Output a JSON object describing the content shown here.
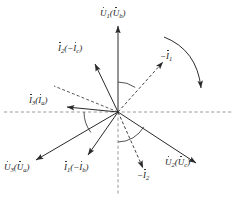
{
  "figure": {
    "width": 236,
    "height": 199,
    "background": "#ffffff",
    "line_color": "#2a2a2a",
    "dashed_axis_color": "#9a9a9a",
    "label_color": "#1a1a1a",
    "origin": {
      "x": 118,
      "y": 112
    }
  },
  "axes": {
    "horizontal": {
      "name": "horizontal-reference-axis",
      "style": "dashed",
      "y": 112,
      "x1": 4,
      "x2": 232
    },
    "vertical_down": {
      "name": "vertical-reference-axis",
      "style": "dashed",
      "x": 118,
      "y1": 112,
      "y2": 194
    }
  },
  "labels": {
    "u1": {
      "main": "U",
      "main_sub": "1",
      "paren_symbol": "U",
      "paren_sub": "b",
      "text": "U̇1(U̇b)"
    },
    "u2": {
      "main": "U",
      "main_sub": "2",
      "paren_symbol": "U",
      "paren_sub": "c",
      "text": "U̇2(U̇c)"
    },
    "u3": {
      "main": "U",
      "main_sub": "3",
      "paren_symbol": "U",
      "paren_sub": "a",
      "text": "U̇3(U̇a)"
    },
    "i1": {
      "main": "I",
      "main_sub": "1",
      "paren_symbol": "−I",
      "paren_sub": "b",
      "text": "İ1(−İb)"
    },
    "i2": {
      "main": "I",
      "main_sub": "2",
      "paren_symbol": "−I",
      "paren_sub": "c",
      "text": "İ2(−İc)"
    },
    "i3": {
      "main": "I",
      "main_sub": "3",
      "paren_symbol": "I",
      "paren_sub": "a",
      "text": "İ3(İa)"
    },
    "neg_i1": {
      "main": "−I",
      "main_sub": "1",
      "text": "−İ1"
    },
    "neg_i2": {
      "main": "−I",
      "main_sub": "2",
      "text": "−İ2"
    }
  },
  "vectors": [
    {
      "name": "u1-vector",
      "label_key": "u1",
      "style": "solid",
      "angle_deg": 90,
      "tip": {
        "x": 118,
        "y": 26
      }
    },
    {
      "name": "u2-vector",
      "label_key": "u2",
      "style": "solid",
      "angle_deg": -33,
      "tip": {
        "x": 196,
        "y": 163
      }
    },
    {
      "name": "u3-vector",
      "label_key": "u3",
      "style": "solid",
      "angle_deg": 217,
      "tip": {
        "x": 36,
        "y": 160
      }
    },
    {
      "name": "i1-vector",
      "label_key": "i1",
      "style": "solid",
      "angle_deg": 250,
      "tip": {
        "x": 88,
        "y": 155
      }
    },
    {
      "name": "i2-vector",
      "label_key": "i2",
      "style": "solid",
      "angle_deg": 115,
      "tip": {
        "x": 95,
        "y": 64
      }
    },
    {
      "name": "i3-vector",
      "label_key": "i3",
      "style": "solid",
      "angle_deg": 182,
      "tip": {
        "x": 67,
        "y": 107
      }
    },
    {
      "name": "neg-i1-vector",
      "label_key": "neg_i1",
      "style": "dashed",
      "angle_deg": 55,
      "tip": {
        "x": 163,
        "y": 62
      }
    },
    {
      "name": "neg-i2-vector",
      "label_key": "neg_i2",
      "style": "dashed",
      "angle_deg": -72,
      "tip": {
        "x": 143,
        "y": 168
      }
    },
    {
      "name": "dashed-guide-upper-left",
      "label_key": null,
      "style": "dashed",
      "angle_deg": 160,
      "tip": {
        "x": 54,
        "y": 86
      }
    }
  ],
  "angle_arcs": [
    {
      "name": "angle-arc-u1-to-neg-i1",
      "radius": 30
    },
    {
      "name": "angle-arc-horizontal-to-u3",
      "radius": 34
    },
    {
      "name": "angle-arc-vertical-to-u2",
      "radius": 30
    }
  ],
  "rotation_arrow": {
    "name": "rotation-direction-arrow",
    "direction": "clockwise"
  }
}
